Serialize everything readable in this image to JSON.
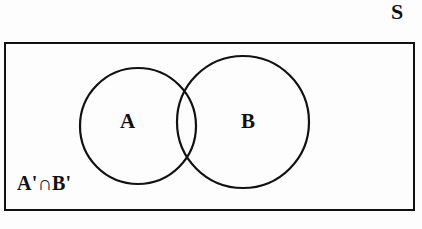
{
  "figure": {
    "type": "venn-diagram",
    "background_color": "#fdfdfd",
    "stroke_color": "#111111"
  },
  "labels": {
    "universal_set": "S",
    "set_a": "A",
    "set_b": "B",
    "complement_region": "A'∩B'"
  },
  "shapes": {
    "universe_rect": {
      "name": "universal-set-rectangle",
      "x": 4,
      "y": 42,
      "width": 410,
      "height": 168,
      "stroke_width": 2
    },
    "circle_a": {
      "name": "set-a-circle",
      "cx": 138,
      "cy": 126,
      "r": 58,
      "stroke_width": 2
    },
    "circle_b": {
      "name": "set-b-circle",
      "cx": 243,
      "cy": 122,
      "r": 66,
      "stroke_width": 2
    }
  }
}
